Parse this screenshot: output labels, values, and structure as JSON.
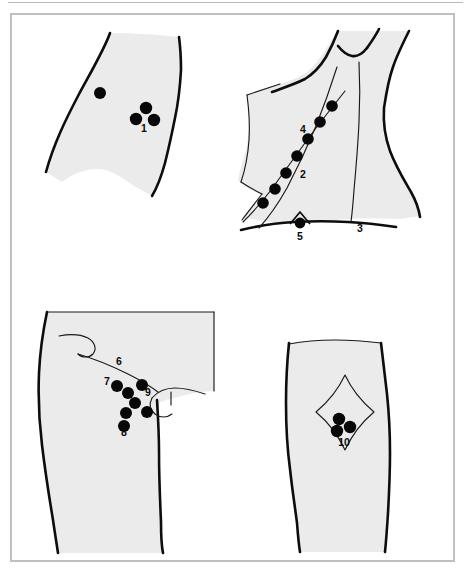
{
  "plate": {
    "title": "Lymph node palpation sites — anatomical plate",
    "frame_color": "#c0c0c0",
    "rule_color": "#b9b9b9",
    "skin_fill": "#ebebeb",
    "ink_color": "#0d0d0d",
    "node_color": "#080808",
    "background": "#ffffff"
  },
  "figures": [
    {
      "id": "fig-upper-arm",
      "name": "upper-arm-epitrochlear",
      "position": "top-left",
      "description": "Oblique segment of upper arm with epitrochlear node group",
      "labels": [
        {
          "id": "1",
          "text": "1",
          "x": 144,
          "y": 132,
          "anchor": "middle"
        }
      ],
      "nodes": [
        {
          "cx": 100,
          "cy": 93,
          "r": 6.0
        },
        {
          "cx": 146,
          "cy": 108,
          "r": 6.2
        },
        {
          "cx": 136,
          "cy": 119,
          "r": 6.2
        },
        {
          "cx": 154,
          "cy": 120,
          "r": 6.2
        }
      ]
    },
    {
      "id": "fig-neck-shoulder",
      "name": "neck-shoulder-cervical-chain",
      "position": "top-right",
      "description": "Neck, shoulder and clavicle with deep cervical node chain",
      "labels": [
        {
          "id": "4",
          "text": "4",
          "x": 303,
          "y": 133,
          "anchor": "middle"
        },
        {
          "id": "2",
          "text": "2",
          "x": 303,
          "y": 178,
          "anchor": "middle"
        },
        {
          "id": "3",
          "text": "3",
          "x": 360,
          "y": 232,
          "anchor": "middle"
        },
        {
          "id": "5",
          "text": "5",
          "x": 300,
          "y": 240,
          "anchor": "middle"
        }
      ],
      "nodes": [
        {
          "cx": 332,
          "cy": 106,
          "r": 5.8
        },
        {
          "cx": 320,
          "cy": 122,
          "r": 5.8
        },
        {
          "cx": 308,
          "cy": 139,
          "r": 5.8
        },
        {
          "cx": 297,
          "cy": 156,
          "r": 5.8
        },
        {
          "cx": 286,
          "cy": 173,
          "r": 5.8
        },
        {
          "cx": 275,
          "cy": 189,
          "r": 5.8
        },
        {
          "cx": 263,
          "cy": 203,
          "r": 5.8
        },
        {
          "cx": 300,
          "cy": 223,
          "r": 5.4
        }
      ]
    },
    {
      "id": "fig-groin",
      "name": "groin-inguinal-nodes",
      "position": "bottom-left",
      "description": "Groin and upper thigh with horizontal and vertical inguinal node groups",
      "labels": [
        {
          "id": "6",
          "text": "6",
          "x": 119,
          "y": 365,
          "anchor": "middle"
        },
        {
          "id": "7",
          "text": "7",
          "x": 107,
          "y": 385,
          "anchor": "middle"
        },
        {
          "id": "8",
          "text": "8",
          "x": 124,
          "y": 436,
          "anchor": "middle"
        },
        {
          "id": "9",
          "text": "9",
          "x": 148,
          "y": 396,
          "anchor": "middle"
        }
      ],
      "nodes": [
        {
          "cx": 117,
          "cy": 386,
          "r": 6.0
        },
        {
          "cx": 128,
          "cy": 393,
          "r": 6.0
        },
        {
          "cx": 142,
          "cy": 385,
          "r": 6.0
        },
        {
          "cx": 135,
          "cy": 403,
          "r": 6.0
        },
        {
          "cx": 126,
          "cy": 413,
          "r": 6.0
        },
        {
          "cx": 147,
          "cy": 412,
          "r": 6.0
        },
        {
          "cx": 124,
          "cy": 426,
          "r": 6.0
        }
      ]
    },
    {
      "id": "fig-knee",
      "name": "knee-popliteal-fossa",
      "position": "bottom-right",
      "description": "Posterior knee with rhomboid popliteal fossa and popliteal nodes",
      "labels": [
        {
          "id": "10",
          "text": "10",
          "x": 344,
          "y": 446,
          "anchor": "middle"
        }
      ],
      "nodes": [
        {
          "cx": 339,
          "cy": 419,
          "r": 6.2
        },
        {
          "cx": 350,
          "cy": 427,
          "r": 6.2
        },
        {
          "cx": 337,
          "cy": 431,
          "r": 6.2
        }
      ]
    }
  ],
  "legend_numbers": [
    "1",
    "2",
    "3",
    "4",
    "5",
    "6",
    "7",
    "8",
    "9",
    "10"
  ]
}
